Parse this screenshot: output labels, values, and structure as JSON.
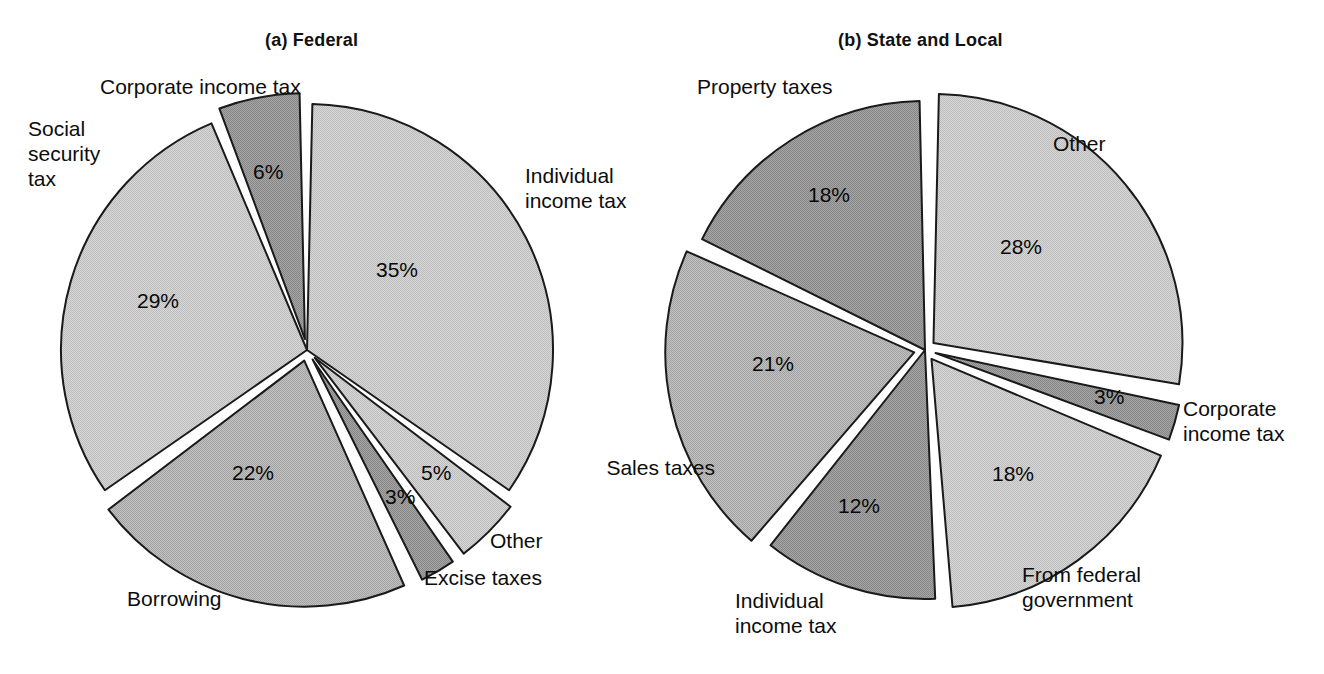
{
  "figure": {
    "background": "#ffffff",
    "width": 1324,
    "height": 674
  },
  "panels": [
    {
      "id": "federal",
      "title": "(a) Federal",
      "title_x": 265,
      "title_y": 30,
      "center_x": 307,
      "center_y": 350,
      "radius": 246
    },
    {
      "id": "state-and-local",
      "title": "(b) State and Local",
      "title_x": 838,
      "title_y": 30,
      "center_x": 925,
      "center_y": 350,
      "radius": 249
    }
  ],
  "colors": {
    "light": "#cdcdcd",
    "medium": "#b4b4b4",
    "dark": "#9a9a9a",
    "outline": "#1a1a1a",
    "gap": "#ffffff",
    "text": "#0d0d0d"
  },
  "labels": {
    "federal": {
      "corporate_income_tax": "Corporate income tax",
      "social_security_tax": "Social\nsecurity\ntax",
      "individual_income_tax": "Individual\nincome tax",
      "other": "Other",
      "excise_taxes": "Excise taxes",
      "borrowing": "Borrowing"
    },
    "state_local": {
      "property_taxes": "Property taxes",
      "other": "Other",
      "corporate_income_tax": "Corporate\nincome tax",
      "from_federal_government": "From federal\ngovernment",
      "individual_income_tax": "Individual\nincome tax",
      "sales_taxes": "Sales taxes"
    }
  },
  "percent_labels": {
    "federal": {
      "individual_income_tax": "35%",
      "other": "5%",
      "excise_taxes": "3%",
      "borrowing": "22%",
      "social_security_tax": "29%",
      "corporate_income_tax": "6%"
    },
    "state_local": {
      "other": "28%",
      "corporate_income_tax": "3%",
      "from_federal_government": "18%",
      "individual_income_tax": "12%",
      "sales_taxes": "21%",
      "property_taxes": "18%"
    }
  },
  "chart_data": [
    {
      "type": "pie",
      "title": "(a) Federal",
      "xlabel": "",
      "ylabel": "",
      "legend_position": "none",
      "grid": false,
      "units": "percent",
      "start_angle_deg": 0,
      "direction": "clockwise",
      "categories": [
        "Individual income tax",
        "Other",
        "Excise taxes",
        "Borrowing",
        "Social security tax",
        "Corporate income tax"
      ],
      "values": [
        35,
        5,
        3,
        22,
        29,
        6
      ],
      "labels": [
        "35%",
        "5%",
        "3%",
        "22%",
        "29%",
        "6%"
      ],
      "slice_fills": [
        "light",
        "light",
        "dark",
        "medium",
        "light",
        "dark"
      ],
      "exploded": [
        false,
        true,
        true,
        true,
        false,
        true
      ],
      "total": 100
    },
    {
      "type": "pie",
      "title": "(b) State and Local",
      "xlabel": "",
      "ylabel": "",
      "legend_position": "none",
      "grid": false,
      "units": "percent",
      "start_angle_deg": 0,
      "direction": "clockwise",
      "categories": [
        "Other",
        "Corporate income tax",
        "From federal government",
        "Individual income tax",
        "Sales taxes",
        "Property taxes"
      ],
      "values": [
        28,
        3,
        18,
        12,
        21,
        18
      ],
      "labels": [
        "28%",
        "3%",
        "18%",
        "12%",
        "21%",
        "18%"
      ],
      "slice_fills": [
        "light",
        "dark",
        "light",
        "dark",
        "medium",
        "dark"
      ],
      "exploded": [
        true,
        true,
        true,
        false,
        true,
        false
      ],
      "total": 100
    }
  ]
}
